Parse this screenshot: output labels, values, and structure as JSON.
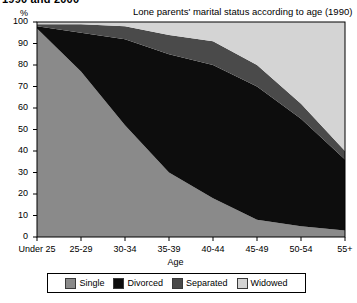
{
  "page": {
    "clipped_heading": "1990 and 2000"
  },
  "chart_data": {
    "type": "area",
    "stacked": true,
    "title": "Lone parents' marital status according to age (1990)",
    "xlabel": "Age",
    "ylabel": "%",
    "ylim": [
      0,
      100
    ],
    "yticks": [
      0,
      10,
      20,
      30,
      40,
      50,
      60,
      70,
      80,
      90,
      100
    ],
    "grid": false,
    "legend_position": "bottom",
    "categories": [
      "Under 25",
      "25-29",
      "30-34",
      "35-39",
      "40-44",
      "45-49",
      "50-54",
      "55+"
    ],
    "series": [
      {
        "name": "Single",
        "color": "#8a8a8a",
        "values": [
          97,
          77,
          52,
          30,
          18,
          8,
          5,
          3
        ]
      },
      {
        "name": "Divorced",
        "color": "#0d0d0d",
        "values": [
          1,
          18,
          40,
          55,
          62,
          62,
          50,
          33
        ]
      },
      {
        "name": "Separated",
        "color": "#4a4a4a",
        "values": [
          1,
          4,
          6,
          9,
          11,
          10,
          7,
          4
        ]
      },
      {
        "name": "Widowed",
        "color": "#d4d4d4",
        "values": [
          1,
          1,
          2,
          6,
          9,
          20,
          38,
          60
        ]
      }
    ]
  },
  "legend": {
    "items": [
      {
        "label": "Single",
        "color": "#8a8a8a"
      },
      {
        "label": "Divorced",
        "color": "#0d0d0d"
      },
      {
        "label": "Separated",
        "color": "#4a4a4a"
      },
      {
        "label": "Widowed",
        "color": "#d4d4d4"
      }
    ]
  }
}
